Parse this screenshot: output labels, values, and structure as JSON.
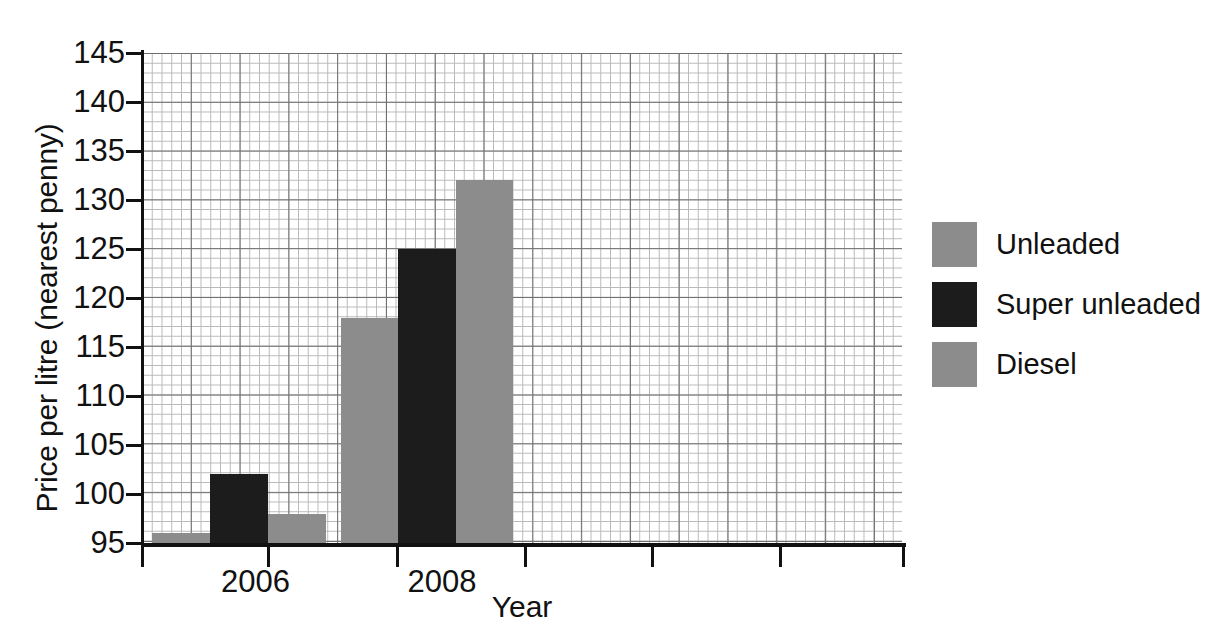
{
  "chart_data": {
    "type": "bar",
    "title": "",
    "xlabel": "Year",
    "ylabel": "Price per litre (nearest penny)",
    "categories": [
      "2006",
      "2008"
    ],
    "series": [
      {
        "name": "Unleaded",
        "color": "#8c8c8c",
        "values": [
          96,
          118
        ]
      },
      {
        "name": "Super unleaded",
        "color": "#1c1c1c",
        "values": [
          102,
          125
        ]
      },
      {
        "name": "Diesel",
        "color": "#8c8c8c",
        "values": [
          98,
          132
        ]
      }
    ],
    "ylim": [
      95,
      145
    ],
    "ytick_labels": [
      "95",
      "100",
      "105",
      "110",
      "115",
      "120",
      "125",
      "130",
      "135",
      "140",
      "145"
    ],
    "ytick_values": [
      95,
      100,
      105,
      110,
      115,
      120,
      125,
      130,
      135,
      140,
      145
    ],
    "grid": "graph-paper minor and major gridlines",
    "legend_position": "right"
  },
  "axis": {
    "y_title": "Price per litre (nearest penny)",
    "x_title": "Year"
  },
  "legend": {
    "entries": [
      {
        "label": "Unleaded",
        "swatch": "#8c8c8c"
      },
      {
        "label": "Super unleaded",
        "swatch": "#1c1c1c"
      },
      {
        "label": "Diesel",
        "swatch": "#8c8c8c"
      }
    ]
  }
}
